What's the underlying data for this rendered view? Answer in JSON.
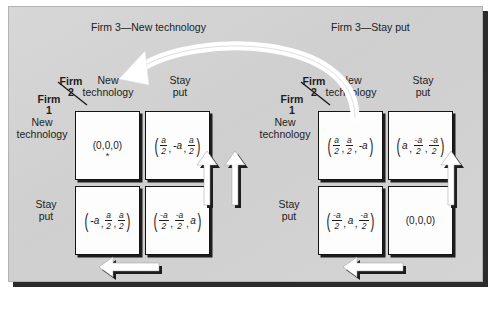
{
  "figure": {
    "type": "game-theory-payoff-matrices",
    "background_color": "#d2d2d2",
    "frame_shadow_color": "#2b2b2b",
    "cell_fill": "#fdfdfd",
    "cell_border": "#141414",
    "arrow_fill": "#ffffff",
    "arrow_shadow": "#1d1d1d"
  },
  "sections": {
    "left": {
      "caption": "Firm 3—New technology"
    },
    "right": {
      "caption": "Firm 3—Stay put"
    }
  },
  "labels": {
    "firm2_line1": "Firm",
    "firm2_line2": "2",
    "firm1_line1": "Firm",
    "firm1_line2": "1",
    "col_new_line1": "New",
    "col_new_line2": "technology",
    "col_stay_line1": "Stay",
    "col_stay_line2": "put",
    "row_new_line1": "New",
    "row_new_line2": "technology",
    "row_stay_line1": "Stay",
    "row_stay_line2": "put"
  },
  "matrices": [
    {
      "name": "firm3-new-technology",
      "rows": [
        "New technology",
        "Stay put"
      ],
      "cols": [
        "New technology",
        "Stay put"
      ],
      "cells": [
        {
          "id": "L-new-new",
          "text": "(0,0,0)",
          "marker": "*",
          "payoff": [
            {
              "kind": "plain",
              "value": "0"
            },
            {
              "kind": "plain",
              "value": "0"
            },
            {
              "kind": "plain",
              "value": "0"
            }
          ]
        },
        {
          "id": "L-new-stay",
          "text": "(a/2, -a, a/2)",
          "marker": "",
          "payoff": [
            {
              "kind": "frac",
              "num": "a",
              "den": "2"
            },
            {
              "kind": "ital",
              "value": "-a"
            },
            {
              "kind": "frac",
              "num": "a",
              "den": "2"
            }
          ]
        },
        {
          "id": "L-stay-new",
          "text": "(-a, a/2, a/2)",
          "marker": "",
          "payoff": [
            {
              "kind": "ital",
              "value": "-a"
            },
            {
              "kind": "frac",
              "num": "a",
              "den": "2"
            },
            {
              "kind": "frac",
              "num": "a",
              "den": "2"
            }
          ]
        },
        {
          "id": "L-stay-stay",
          "text": "(-a/2, -a/2, a)",
          "marker": "",
          "payoff": [
            {
              "kind": "frac",
              "num": "-a",
              "den": "2"
            },
            {
              "kind": "frac",
              "num": "-a",
              "den": "2"
            },
            {
              "kind": "ital",
              "value": "a"
            }
          ]
        }
      ]
    },
    {
      "name": "firm3-stay-put",
      "rows": [
        "New technology",
        "Stay put"
      ],
      "cols": [
        "New technology",
        "Stay put"
      ],
      "cells": [
        {
          "id": "R-new-new",
          "text": "(a/2, a/2, -a)",
          "marker": "",
          "payoff": [
            {
              "kind": "frac",
              "num": "a",
              "den": "2"
            },
            {
              "kind": "frac",
              "num": "a",
              "den": "2"
            },
            {
              "kind": "ital",
              "value": "-a"
            }
          ]
        },
        {
          "id": "R-new-stay",
          "text": "(a, -a/2, -a/2)",
          "marker": "",
          "payoff": [
            {
              "kind": "ital",
              "value": "a"
            },
            {
              "kind": "frac",
              "num": "-a",
              "den": "2"
            },
            {
              "kind": "frac",
              "num": "-a",
              "den": "2"
            }
          ]
        },
        {
          "id": "R-stay-new",
          "text": "(-a/2, a, -a/2)",
          "marker": "",
          "payoff": [
            {
              "kind": "frac",
              "num": "-a",
              "den": "2"
            },
            {
              "kind": "ital",
              "value": "a"
            },
            {
              "kind": "frac",
              "num": "-a",
              "den": "2"
            }
          ]
        },
        {
          "id": "R-stay-stay",
          "text": "(0,0,0)",
          "marker": "",
          "payoff": [
            {
              "kind": "plain",
              "value": "0"
            },
            {
              "kind": "plain",
              "value": "0"
            },
            {
              "kind": "plain",
              "value": "0"
            }
          ]
        }
      ]
    }
  ],
  "arrows": {
    "curved": {
      "name": "best-response-curved-arrow",
      "direction": "right-to-left-over-top"
    },
    "left_up": {
      "name": "left-matrix-up-arrow",
      "direction": "up"
    },
    "left_bottom": {
      "name": "left-matrix-left-arrow",
      "direction": "left"
    },
    "left_side_up": {
      "name": "left-matrix-side-up-arrow",
      "direction": "up"
    },
    "right_up": {
      "name": "right-matrix-up-arrow",
      "direction": "up"
    },
    "right_bottom": {
      "name": "right-matrix-left-arrow",
      "direction": "left"
    },
    "right_side_up": {
      "name": "right-matrix-side-up-arrow",
      "direction": "up"
    }
  }
}
